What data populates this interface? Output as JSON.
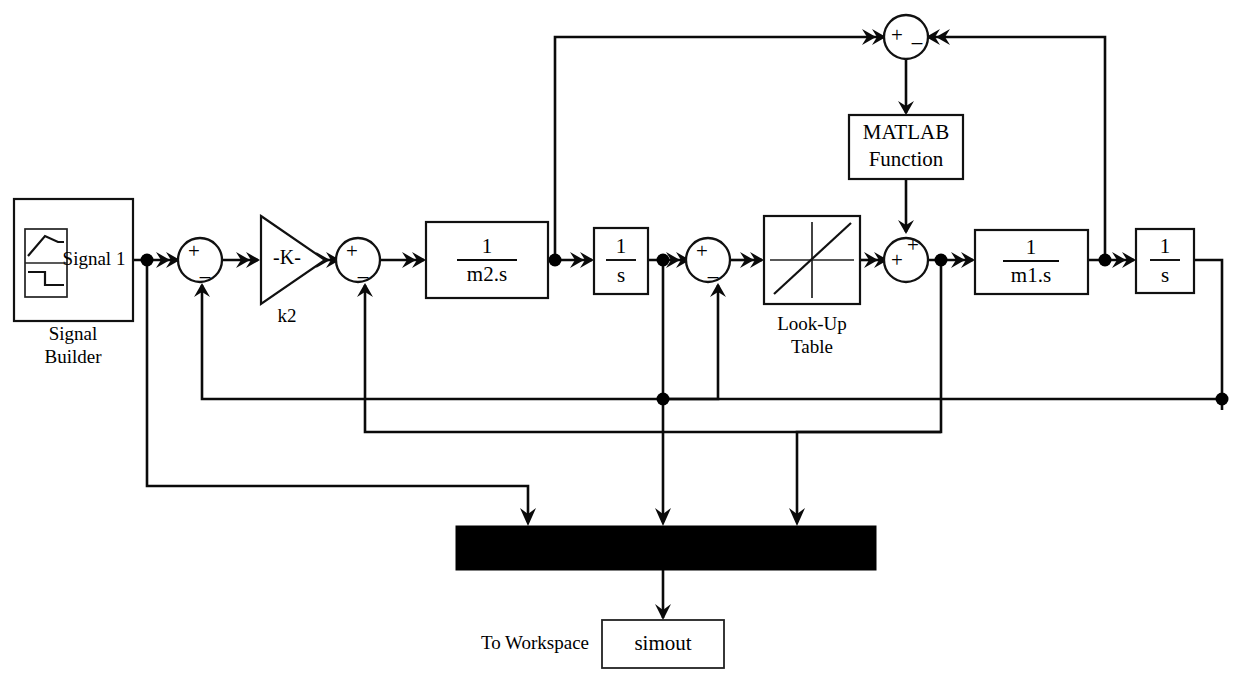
{
  "diagram": {
    "background_color": "#ffffff",
    "line_color": "#0a0a0a"
  },
  "blocks": {
    "signal_builder": {
      "label": "Signal Builder",
      "port_label": "Signal 1",
      "icon": "signal-builder-icon"
    },
    "gain": {
      "value": "-K-",
      "label": "k2"
    },
    "tf_m2": {
      "numerator": "1",
      "denominator": "m2.s"
    },
    "integrator_1": {
      "numerator": "1",
      "denominator": "s"
    },
    "lookup_table": {
      "label_line1": "Look-Up",
      "label_line2": "Table",
      "icon": "lookup-table-icon"
    },
    "matlab_function": {
      "label_line1": "MATLAB",
      "label_line2": "Function"
    },
    "tf_m1": {
      "numerator": "1",
      "denominator": "m1.s"
    },
    "integrator_2": {
      "numerator": "1",
      "denominator": "s"
    },
    "mux": {
      "label": "",
      "color": "#000000",
      "inputs": 3
    },
    "to_workspace": {
      "label": "To Workspace",
      "variable": "simout"
    }
  },
  "sum_blocks": [
    {
      "id": "sum1",
      "signs": [
        "+",
        "–"
      ],
      "layout": "vertical"
    },
    {
      "id": "sum2",
      "signs": [
        "+",
        "–"
      ],
      "layout": "vertical"
    },
    {
      "id": "sum3",
      "signs": [
        "+",
        "–"
      ],
      "layout": "vertical"
    },
    {
      "id": "sum4",
      "signs": [
        "+",
        "+"
      ],
      "layout": "corner"
    },
    {
      "id": "sum_top",
      "signs": [
        "+",
        "–"
      ],
      "layout": "horizontal"
    }
  ]
}
